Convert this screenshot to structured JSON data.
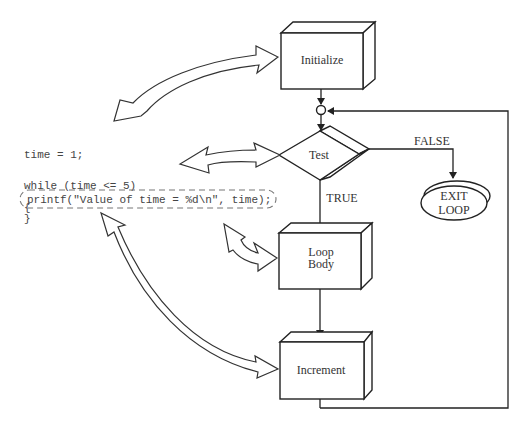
{
  "code": {
    "line1": "time = 1;",
    "line2": "while (time <= 5)",
    "line3": "{",
    "line4": "printf(\"Value of time = %d\\n\", time);",
    "line5": "}"
  },
  "flowchart": {
    "initialize": "Initialize",
    "test": "Test",
    "false_label": "FALSE",
    "true_label": "TRUE",
    "exit_line1": "EXIT",
    "exit_line2": "LOOP",
    "loop_body_line1": "Loop",
    "loop_body_line2": "Body",
    "increment": "Increment"
  }
}
